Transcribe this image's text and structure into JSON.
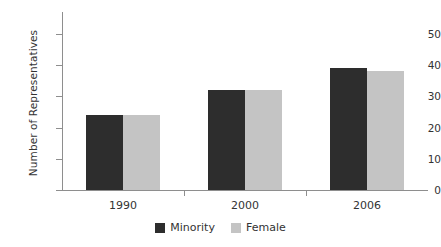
{
  "chart_data": {
    "type": "bar",
    "title": "",
    "subtitle": "",
    "xlabel": "",
    "ylabel": "Number of Representatives",
    "categories": [
      "1990",
      "2000",
      "2006"
    ],
    "series": [
      {
        "name": "Minority",
        "values": [
          24,
          32,
          39
        ],
        "color": "#2d2d2d"
      },
      {
        "name": "Female",
        "values": [
          24,
          32,
          38
        ],
        "color": "#c4c4c4"
      }
    ],
    "ylim": [
      0,
      50
    ],
    "yticks": [
      0,
      10,
      20,
      30,
      40,
      50
    ],
    "ytick_labels": [
      "0",
      "10",
      "20",
      "30",
      "40",
      "50"
    ],
    "grid": false,
    "legend_position": "bottom"
  },
  "axes": {
    "y_title": "Number of Representatives",
    "y_tick_labels": [
      "50",
      "40",
      "30",
      "20",
      "10",
      "0"
    ],
    "x_tick_labels": [
      "1990",
      "2000",
      "2006"
    ]
  },
  "legend": {
    "items": [
      {
        "label": "Minority",
        "color": "#2d2d2d"
      },
      {
        "label": "Female",
        "color": "#c4c4c4"
      }
    ]
  },
  "colors": {
    "series_minority": "#2d2d2d",
    "series_female": "#c4c4c4",
    "axis": "#8e8e8e",
    "text": "#333333",
    "background": "#ffffff"
  }
}
